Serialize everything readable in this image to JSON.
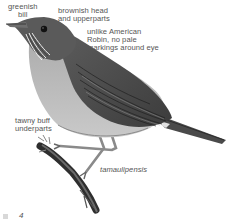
{
  "figure": {
    "subspecies_label": "tamaulipensis",
    "annotations": [
      {
        "id": "bill",
        "lines": [
          "greenish",
          "bill"
        ]
      },
      {
        "id": "head",
        "lines": [
          "brownish head",
          "and upperparts"
        ]
      },
      {
        "id": "robin",
        "lines": [
          "unlike American",
          "Robin, no pale",
          "markings around eye"
        ]
      },
      {
        "id": "underparts",
        "lines": [
          "tawny buff",
          "underparts"
        ]
      }
    ]
  },
  "footer": {
    "page_number": "4"
  },
  "colors": {
    "label_text": "#555555",
    "bird_dark": "#3a3a3a",
    "bird_mid": "#7a7a7a",
    "bird_light": "#bdbdbd",
    "background": "#ffffff"
  }
}
